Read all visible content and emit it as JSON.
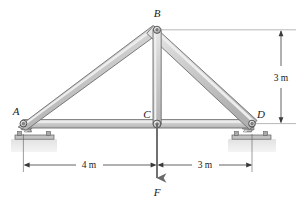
{
  "figure": {
    "type": "truss-free-body-diagram",
    "background_color": "#ffffff"
  },
  "joints": [
    {
      "id": "A",
      "label": "A",
      "x": 22,
      "y": 124,
      "support": "pin-rocker"
    },
    {
      "id": "B",
      "label": "B",
      "x": 157,
      "y": 30,
      "support": "none"
    },
    {
      "id": "C",
      "label": "C",
      "x": 157,
      "y": 124,
      "support": "none"
    },
    {
      "id": "D",
      "label": "D",
      "x": 253,
      "y": 124,
      "support": "pin-rocker"
    }
  ],
  "labels": {
    "A": "A",
    "B": "B",
    "C": "C",
    "D": "D",
    "F": "F"
  },
  "members": [
    {
      "name": "AB",
      "from": "A",
      "to": "B"
    },
    {
      "name": "BD",
      "from": "B",
      "to": "D"
    },
    {
      "name": "AC",
      "from": "A",
      "to": "C"
    },
    {
      "name": "CD",
      "from": "C",
      "to": "D"
    },
    {
      "name": "BC",
      "from": "B",
      "to": "C"
    }
  ],
  "load": {
    "label": "F",
    "at_joint": "C",
    "direction": "down",
    "arrow_tip_y": 180,
    "label_x": 157,
    "label_y": 196
  },
  "dimensions": [
    {
      "name": "span-left",
      "text": "4 m",
      "orientation": "horizontal",
      "from": "A",
      "to": "C",
      "x": 89,
      "y": 165
    },
    {
      "name": "span-right",
      "text": "3 m",
      "orientation": "horizontal",
      "from": "C",
      "to": "D",
      "x": 205,
      "y": 165
    },
    {
      "name": "height",
      "text": "3 m",
      "orientation": "vertical",
      "from": "D-level",
      "to": "B-level",
      "x": 281,
      "y": 77
    }
  ],
  "colors": {
    "member_fill": "#c5c5c5",
    "member_fill_light": "#e4e4e4",
    "member_stroke": "#6e6e6e",
    "pin_fill": "#d0d0d0",
    "pin_stroke": "#4a4a4a",
    "support_fill": "#b9b9b9",
    "support_stroke": "#5a5a5a",
    "ground_fill": "#dcdcdc",
    "line": "#3a3a3a",
    "text": "#1a1a1a",
    "caption": "#c9c9c9"
  },
  "caption": {
    "text": "Fig. truss",
    "visible": false
  }
}
